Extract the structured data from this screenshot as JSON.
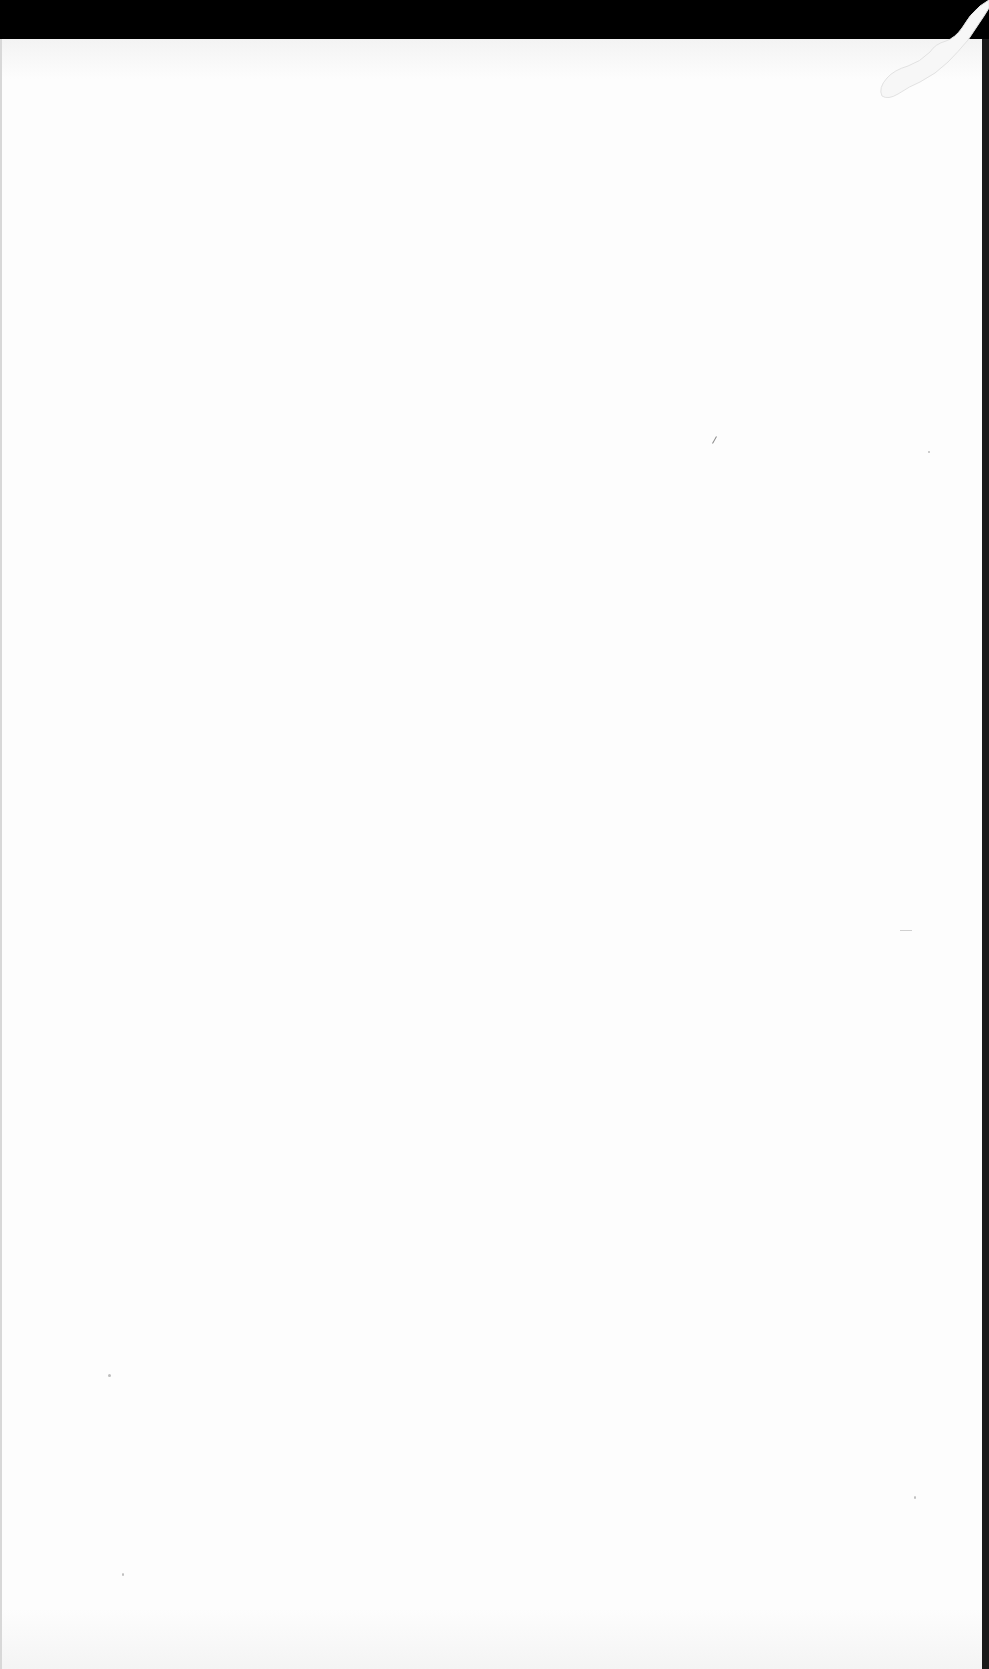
{
  "document": {
    "type": "blank scanned page",
    "text": "",
    "colors": {
      "paper": "#fdfdfd",
      "scan_border": "#000000",
      "right_edge": "#1a1a1a"
    },
    "artifacts": [
      {
        "name": "top-scanner-band",
        "kind": "black border"
      },
      {
        "name": "top-right-curl",
        "kind": "white paper curl"
      },
      {
        "name": "right-edge-shadow",
        "kind": "dark edge strip"
      }
    ]
  }
}
